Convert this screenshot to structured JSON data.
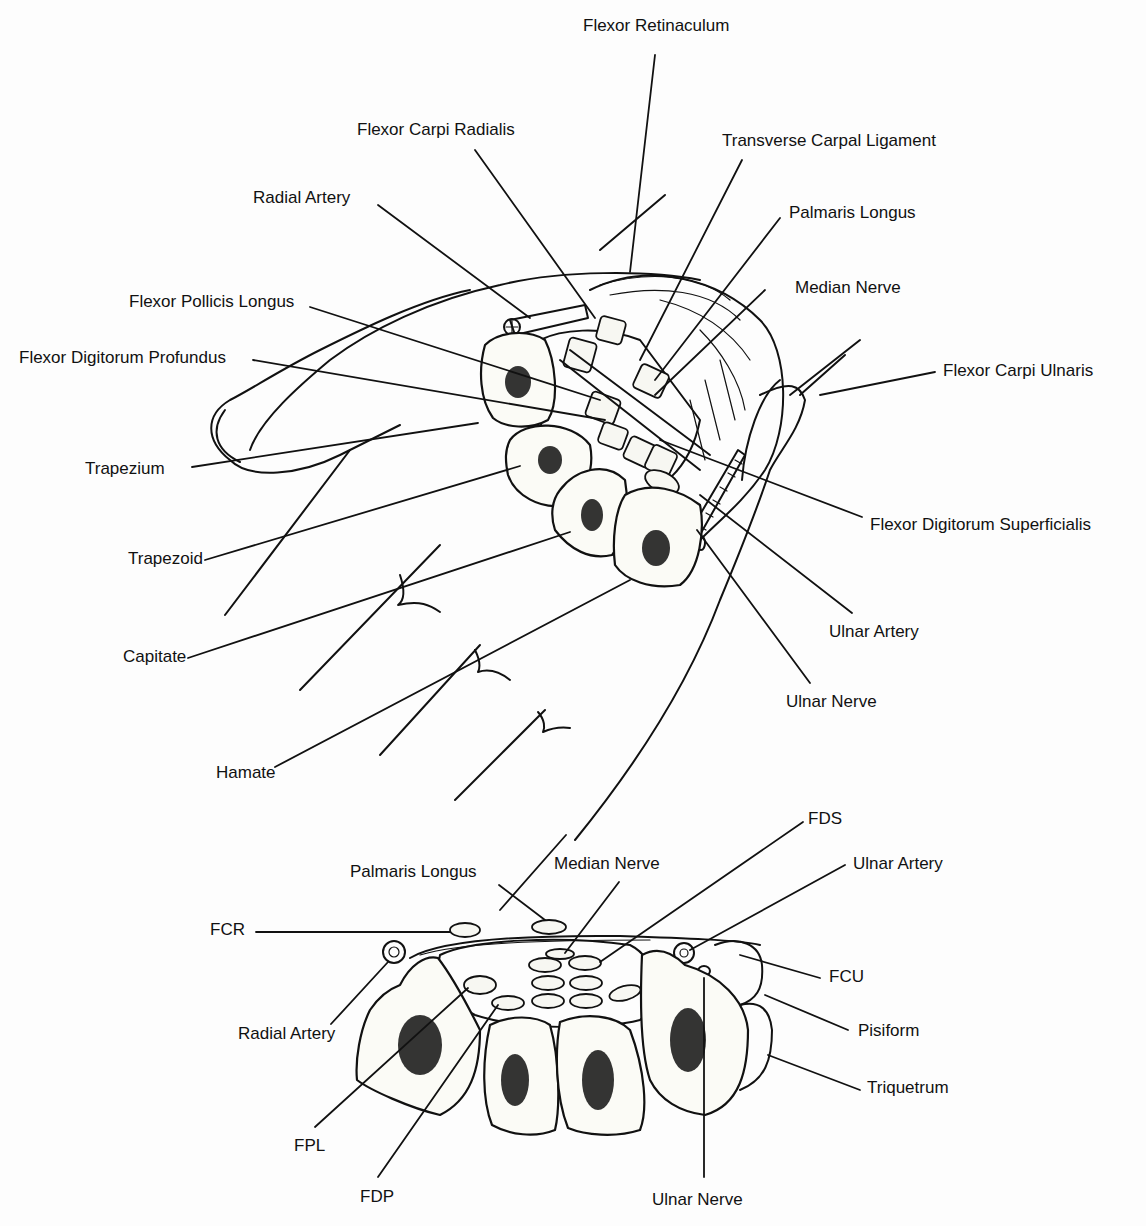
{
  "figure": {
    "top_view": {
      "title": "Carpal tunnel — palmar view of wrist (upper illustration)",
      "labels": [
        {
          "id": "flexor_retinaculum",
          "text": "Flexor Retinaculum"
        },
        {
          "id": "flexor_carpi_radialis",
          "text": "Flexor Carpi Radialis"
        },
        {
          "id": "transverse_carpal_ligament",
          "text": "Transverse Carpal Ligament"
        },
        {
          "id": "radial_artery",
          "text": "Radial Artery"
        },
        {
          "id": "palmaris_longus",
          "text": "Palmaris Longus"
        },
        {
          "id": "flexor_pollicis_longus",
          "text": "Flexor Pollicis Longus"
        },
        {
          "id": "median_nerve",
          "text": "Median Nerve"
        },
        {
          "id": "flexor_digitorum_profundus",
          "text": "Flexor Digitorum Profundus"
        },
        {
          "id": "flexor_carpi_ulnaris",
          "text": "Flexor Carpi Ulnaris"
        },
        {
          "id": "trapezium",
          "text": "Trapezium"
        },
        {
          "id": "flexor_digitorum_superficialis",
          "text": "Flexor Digitorum Superficialis"
        },
        {
          "id": "trapezoid",
          "text": "Trapezoid"
        },
        {
          "id": "ulnar_artery",
          "text": "Ulnar Artery"
        },
        {
          "id": "capitate",
          "text": "Capitate"
        },
        {
          "id": "ulnar_nerve",
          "text": "Ulnar Nerve"
        },
        {
          "id": "hamate",
          "text": "Hamate"
        }
      ]
    },
    "cross_section": {
      "title": "Carpal tunnel — cross-section (lower illustration)",
      "labels": [
        {
          "id": "fds",
          "text": "FDS"
        },
        {
          "id": "median_nerve",
          "text": "Median Nerve"
        },
        {
          "id": "ulnar_artery",
          "text": "Ulnar Artery"
        },
        {
          "id": "palmaris_longus",
          "text": "Palmaris Longus"
        },
        {
          "id": "fcr",
          "text": "FCR"
        },
        {
          "id": "fcu",
          "text": "FCU"
        },
        {
          "id": "pisiform",
          "text": "Pisiform"
        },
        {
          "id": "radial_artery",
          "text": "Radial Artery"
        },
        {
          "id": "triquetrum",
          "text": "Triquetrum"
        },
        {
          "id": "fpl",
          "text": "FPL"
        },
        {
          "id": "fdp",
          "text": "FDP"
        },
        {
          "id": "ulnar_nerve",
          "text": "Ulnar Nerve"
        }
      ]
    }
  }
}
